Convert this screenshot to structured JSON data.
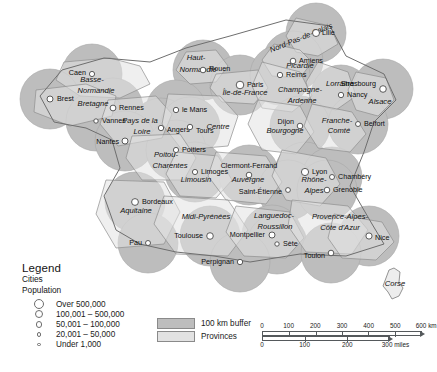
{
  "map": {
    "title": "France — Provinces with 100 km city buffers",
    "colors": {
      "buffer": "#bdbdbd",
      "province": "#e2e2e2",
      "province_outline": "#8e8e8e",
      "buffer_outline": "#a8a8a8",
      "city_marker": "#ffffff",
      "city_outline": "#4a4a4a",
      "background": "#ffffff"
    },
    "provinces": [
      {
        "name": "Nord-Pas-de-Calais",
        "x": 302,
        "y": 40,
        "rot": -22
      },
      {
        "name": "Picardie",
        "x": 300,
        "y": 68,
        "rot": 0
      },
      {
        "name": "Haut-",
        "x": 196,
        "y": 60,
        "rot": 0
      },
      {
        "name": "Normandie",
        "x": 198,
        "y": 72,
        "rot": 0
      },
      {
        "name": "Basse-",
        "x": 92,
        "y": 82,
        "rot": 0
      },
      {
        "name": "Normandie",
        "x": 96,
        "y": 93,
        "rot": 0
      },
      {
        "name": "Île-de-France",
        "x": 245,
        "y": 95,
        "rot": 0
      },
      {
        "name": "Champagne-",
        "x": 300,
        "y": 92,
        "rot": 0
      },
      {
        "name": "Ardenne",
        "x": 302,
        "y": 103,
        "rot": 0
      },
      {
        "name": "Lorraine",
        "x": 340,
        "y": 86,
        "rot": 0
      },
      {
        "name": "Alsace",
        "x": 380,
        "y": 104,
        "rot": 0
      },
      {
        "name": "Bretagne",
        "x": 93,
        "y": 106,
        "rot": 0
      },
      {
        "name": "Pays de la",
        "x": 140,
        "y": 123,
        "rot": 0
      },
      {
        "name": "Loire",
        "x": 142,
        "y": 134,
        "rot": 0
      },
      {
        "name": "Centre",
        "x": 218,
        "y": 129,
        "rot": 0
      },
      {
        "name": "Bourgogne",
        "x": 285,
        "y": 133,
        "rot": 0
      },
      {
        "name": "Franche-",
        "x": 337,
        "y": 123,
        "rot": 0
      },
      {
        "name": "Comté",
        "x": 339,
        "y": 133,
        "rot": 0
      },
      {
        "name": "Poitou-",
        "x": 166,
        "y": 157,
        "rot": 0
      },
      {
        "name": "Charentes",
        "x": 170,
        "y": 168,
        "rot": 0
      },
      {
        "name": "Limousin",
        "x": 196,
        "y": 182,
        "rot": 0
      },
      {
        "name": "Auvergne",
        "x": 248,
        "y": 182,
        "rot": 0
      },
      {
        "name": "Rhône-",
        "x": 314,
        "y": 182,
        "rot": 0
      },
      {
        "name": "Alpes",
        "x": 314,
        "y": 193,
        "rot": 0
      },
      {
        "name": "Aquitaine",
        "x": 136,
        "y": 213,
        "rot": 0
      },
      {
        "name": "Midi-Pyrénées",
        "x": 206,
        "y": 219,
        "rot": 0
      },
      {
        "name": "Languedoc-",
        "x": 274,
        "y": 218,
        "rot": 0
      },
      {
        "name": "Roussillon",
        "x": 275,
        "y": 229,
        "rot": 0
      },
      {
        "name": "Provence-Alpes-",
        "x": 340,
        "y": 219,
        "rot": 0
      },
      {
        "name": "Côte d'Azur",
        "x": 340,
        "y": 230,
        "rot": 0
      },
      {
        "name": "Corse",
        "x": 395,
        "y": 286,
        "rot": 0
      }
    ],
    "cities": [
      {
        "name": "Lille",
        "x": 316,
        "y": 33,
        "size": 7.0,
        "lx": 322,
        "ly": 33,
        "anchor": "start"
      },
      {
        "name": "Amiens",
        "x": 293,
        "y": 61,
        "size": 5.6,
        "lx": 299,
        "ly": 61,
        "anchor": "start"
      },
      {
        "name": "Rouen",
        "x": 203,
        "y": 70,
        "size": 5.6,
        "lx": 209,
        "ly": 69,
        "anchor": "start"
      },
      {
        "name": "Caen",
        "x": 92,
        "y": 74,
        "size": 5.2,
        "lx": 86,
        "ly": 73,
        "anchor": "end"
      },
      {
        "name": "Paris",
        "x": 240,
        "y": 85,
        "size": 7.6,
        "lx": 247,
        "ly": 85,
        "anchor": "start"
      },
      {
        "name": "Reims",
        "x": 280,
        "y": 75,
        "size": 5.4,
        "lx": 286,
        "ly": 75,
        "anchor": "start"
      },
      {
        "name": "Nancy",
        "x": 341,
        "y": 95,
        "size": 5.4,
        "lx": 347,
        "ly": 95,
        "anchor": "start"
      },
      {
        "name": "Strasbourg",
        "x": 383,
        "y": 89,
        "size": 6.6,
        "lx": 376,
        "ly": 84,
        "anchor": "end"
      },
      {
        "name": "Brest",
        "x": 50,
        "y": 99,
        "size": 6.0,
        "lx": 57,
        "ly": 99,
        "anchor": "start"
      },
      {
        "name": "Rennes",
        "x": 113,
        "y": 108,
        "size": 5.8,
        "lx": 119,
        "ly": 108,
        "anchor": "start"
      },
      {
        "name": "le Mans",
        "x": 176,
        "y": 110,
        "size": 5.4,
        "lx": 182,
        "ly": 110,
        "anchor": "start"
      },
      {
        "name": "Vannes",
        "x": 96,
        "y": 121,
        "size": 4.4,
        "lx": 102,
        "ly": 121,
        "anchor": "start"
      },
      {
        "name": "Angers",
        "x": 161,
        "y": 128,
        "size": 5.4,
        "lx": 167,
        "ly": 130,
        "anchor": "start"
      },
      {
        "name": "Tours",
        "x": 190,
        "y": 127,
        "size": 5.4,
        "lx": 196,
        "ly": 131,
        "anchor": "start"
      },
      {
        "name": "Dijon",
        "x": 300,
        "y": 126,
        "size": 5.6,
        "lx": 294,
        "ly": 122,
        "anchor": "end"
      },
      {
        "name": "Belfort",
        "x": 358,
        "y": 124,
        "size": 5.0,
        "lx": 364,
        "ly": 124,
        "anchor": "start"
      },
      {
        "name": "Nantes",
        "x": 125,
        "y": 141,
        "size": 6.0,
        "lx": 119,
        "ly": 142,
        "anchor": "end"
      },
      {
        "name": "Poitiers",
        "x": 176,
        "y": 150,
        "size": 5.2,
        "lx": 182,
        "ly": 150,
        "anchor": "start"
      },
      {
        "name": "Limoges",
        "x": 195,
        "y": 172,
        "size": 5.2,
        "lx": 201,
        "ly": 172,
        "anchor": "start"
      },
      {
        "name": "Clermont-Ferrand",
        "x": 249,
        "y": 175,
        "size": 5.6,
        "lx": 249,
        "ly": 166,
        "anchor": "middle"
      },
      {
        "name": "Lyon",
        "x": 305,
        "y": 172,
        "size": 7.2,
        "lx": 312,
        "ly": 172,
        "anchor": "start"
      },
      {
        "name": "Chambéry",
        "x": 332,
        "y": 177,
        "size": 5.0,
        "lx": 338,
        "ly": 177,
        "anchor": "start"
      },
      {
        "name": "Saint-Étienne",
        "x": 288,
        "y": 190,
        "size": 4.8,
        "lx": 282,
        "ly": 192,
        "anchor": "end"
      },
      {
        "name": "Grenoble",
        "x": 327,
        "y": 190,
        "size": 5.6,
        "lx": 333,
        "ly": 190,
        "anchor": "start"
      },
      {
        "name": "Bordeaux",
        "x": 135,
        "y": 202,
        "size": 6.8,
        "lx": 142,
        "ly": 202,
        "anchor": "start"
      },
      {
        "name": "Toulouse",
        "x": 210,
        "y": 236,
        "size": 6.6,
        "lx": 203,
        "ly": 236,
        "anchor": "end"
      },
      {
        "name": "Montpellier",
        "x": 272,
        "y": 235,
        "size": 6.0,
        "lx": 265,
        "ly": 235,
        "anchor": "end"
      },
      {
        "name": "Sète",
        "x": 277,
        "y": 244,
        "size": 4.4,
        "lx": 283,
        "ly": 244,
        "anchor": "start"
      },
      {
        "name": "Nice",
        "x": 369,
        "y": 236,
        "size": 6.2,
        "lx": 375,
        "ly": 238,
        "anchor": "start"
      },
      {
        "name": "Toulon",
        "x": 331,
        "y": 253,
        "size": 5.6,
        "lx": 325,
        "ly": 256,
        "anchor": "end"
      },
      {
        "name": "Pau",
        "x": 148,
        "y": 243,
        "size": 5.0,
        "lx": 142,
        "ly": 243,
        "anchor": "end"
      },
      {
        "name": "Perpignan",
        "x": 240,
        "y": 262,
        "size": 5.4,
        "lx": 234,
        "ly": 262,
        "anchor": "end"
      }
    ]
  },
  "legend": {
    "title": "Legend",
    "subtitle_1": "Cities",
    "subtitle_2": "Population",
    "population_classes": [
      {
        "label": "Over 500,000",
        "radius": 5.0
      },
      {
        "label": "100,001 – 500,000",
        "radius": 4.2
      },
      {
        "label": "50,001 – 100,000",
        "radius": 3.4
      },
      {
        "label": "20,001 – 50,000",
        "radius": 2.4
      },
      {
        "label": "Under 1,000",
        "radius": 1.6
      }
    ],
    "swatches": [
      {
        "label": "100 km buffer",
        "color": "#bdbdbd"
      },
      {
        "label": "Provinces",
        "color": "#e2e2e2"
      }
    ]
  },
  "scale": {
    "km": {
      "unit": "km",
      "ticks": [
        "0",
        "100",
        "200",
        "300",
        "400",
        "500",
        "600"
      ],
      "max": 600
    },
    "miles": {
      "unit": "miles",
      "ticks": [
        "0",
        "100",
        "200",
        "300"
      ],
      "max": 300
    }
  }
}
